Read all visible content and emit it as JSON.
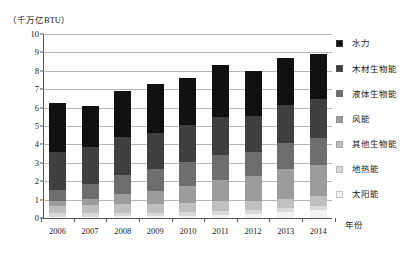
{
  "chart_data": {
    "type": "bar",
    "subtype": "stacked-column",
    "title": "",
    "unit_label": "（千万亿BTU）",
    "xlabel": "年份",
    "ylabel": "",
    "ylim": [
      0,
      10
    ],
    "yticks": [
      0,
      1,
      2,
      3,
      4,
      5,
      6,
      7,
      8,
      9,
      10
    ],
    "grid": true,
    "legend_position": "right",
    "categories": [
      "2006",
      "2007",
      "2008",
      "2009",
      "2010",
      "2011",
      "2012",
      "2013",
      "2014"
    ],
    "series": [
      {
        "name": "太阳能",
        "color": "#f2f2f2",
        "values": [
          0.07,
          0.08,
          0.09,
          0.1,
          0.13,
          0.17,
          0.23,
          0.34,
          0.43
        ]
      },
      {
        "name": "地热能",
        "color": "#d9d9d9",
        "values": [
          0.18,
          0.19,
          0.19,
          0.2,
          0.21,
          0.22,
          0.21,
          0.21,
          0.22
        ]
      },
      {
        "name": "其他生物能",
        "color": "#bfbfbf",
        "values": [
          0.42,
          0.44,
          0.46,
          0.47,
          0.49,
          0.51,
          0.5,
          0.51,
          0.52
        ]
      },
      {
        "name": "风能",
        "color": "#9c9c9c",
        "values": [
          0.26,
          0.34,
          0.55,
          0.72,
          0.92,
          1.17,
          1.34,
          1.6,
          1.73
        ]
      },
      {
        "name": "液体生物能",
        "color": "#6e6e6e",
        "values": [
          0.6,
          0.79,
          1.06,
          1.2,
          1.32,
          1.37,
          1.3,
          1.4,
          1.47
        ]
      },
      {
        "name": "木材生物能",
        "color": "#3f3f3f",
        "values": [
          2.05,
          2.0,
          2.05,
          1.93,
          2.0,
          2.03,
          1.99,
          2.09,
          2.08
        ]
      },
      {
        "name": "水力",
        "color": "#111111",
        "values": [
          2.67,
          2.23,
          2.51,
          2.67,
          2.54,
          2.85,
          2.43,
          2.56,
          2.48
        ]
      }
    ],
    "totals": [
      6.25,
      6.07,
      6.91,
      7.29,
      7.61,
      8.32,
      8.0,
      8.71,
      8.93
    ]
  },
  "legend": {
    "items": [
      {
        "label": "水力"
      },
      {
        "label": "木材生物能"
      },
      {
        "label": "液体生物能"
      },
      {
        "label": "风能"
      },
      {
        "label": "其他生物能"
      },
      {
        "label": "地热能"
      },
      {
        "label": "太阳能"
      }
    ]
  }
}
